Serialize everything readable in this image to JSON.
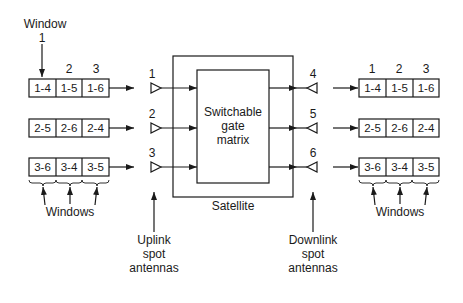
{
  "diagram": {
    "type": "satellite-switched-TDMA",
    "left": {
      "window_label": "Window",
      "window_numbers": [
        "1",
        "2",
        "3"
      ],
      "rows": [
        {
          "antenna": "1",
          "cells": [
            "1-4",
            "1-5",
            "1-6"
          ]
        },
        {
          "antenna": "2",
          "cells": [
            "2-5",
            "2-6",
            "2-4"
          ]
        },
        {
          "antenna": "3",
          "cells": [
            "3-6",
            "3-4",
            "3-5"
          ]
        }
      ],
      "windows_label": "Windows"
    },
    "satellite": {
      "label": "Satellite",
      "matrix_lines": [
        "Switchable",
        "gate",
        "matrix"
      ]
    },
    "right": {
      "window_numbers": [
        "1",
        "2",
        "3"
      ],
      "rows": [
        {
          "antenna": "4",
          "cells": [
            "1-4",
            "1-5",
            "1-6"
          ]
        },
        {
          "antenna": "5",
          "cells": [
            "2-5",
            "2-6",
            "2-4"
          ]
        },
        {
          "antenna": "6",
          "cells": [
            "3-6",
            "3-4",
            "3-5"
          ]
        }
      ],
      "windows_label": "Windows"
    },
    "uplink_label": [
      "Uplink",
      "spot",
      "antennas"
    ],
    "downlink_label": [
      "Downlink",
      "spot",
      "antennas"
    ]
  }
}
